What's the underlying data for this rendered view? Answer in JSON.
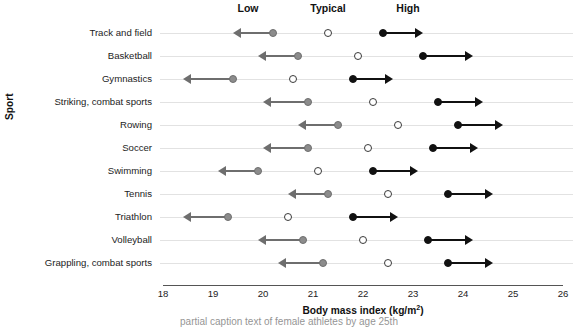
{
  "chart_data": {
    "type": "scatter",
    "title": "",
    "xlabel": "Body mass index (kg/m2)",
    "xlabel_html": "Body mass index (kg/m<sup>2</sup>)",
    "ylabel": "Sport",
    "xlim": [
      18,
      26
    ],
    "xticks": [
      18,
      19,
      20,
      21,
      22,
      23,
      24,
      25,
      26
    ],
    "grid": true,
    "legend_position": "top",
    "series": [
      {
        "name": "Low",
        "marker": "filled-gray-circle",
        "color": "#8c8c8c",
        "arrow": "left"
      },
      {
        "name": "Typical",
        "marker": "open-circle",
        "color": "#ffffff",
        "arrow": "none"
      },
      {
        "name": "High",
        "marker": "filled-black-circle",
        "color": "#111111",
        "arrow": "right"
      }
    ],
    "categories": [
      "Track and field",
      "Basketball",
      "Gymnastics",
      "Striking, combat sports",
      "Rowing",
      "Soccer",
      "Swimming",
      "Tennis",
      "Triathlon",
      "Volleyball",
      "Grappling, combat sports"
    ],
    "rows": [
      {
        "sport": "Track and field",
        "low": 20.2,
        "typical": 21.3,
        "high": 22.4,
        "low_arrow_end": 19.4,
        "high_arrow_end": 23.2
      },
      {
        "sport": "Basketball",
        "low": 20.7,
        "typical": 21.9,
        "high": 23.2,
        "low_arrow_end": 19.9,
        "high_arrow_end": 24.2
      },
      {
        "sport": "Gymnastics",
        "low": 19.4,
        "typical": 20.6,
        "high": 21.8,
        "low_arrow_end": 18.4,
        "high_arrow_end": 22.6
      },
      {
        "sport": "Striking, combat sports",
        "low": 20.9,
        "typical": 22.2,
        "high": 23.5,
        "low_arrow_end": 20.0,
        "high_arrow_end": 24.4
      },
      {
        "sport": "Rowing",
        "low": 21.5,
        "typical": 22.7,
        "high": 23.9,
        "low_arrow_end": 20.7,
        "high_arrow_end": 24.8
      },
      {
        "sport": "Soccer",
        "low": 20.9,
        "typical": 22.1,
        "high": 23.4,
        "low_arrow_end": 20.0,
        "high_arrow_end": 24.3
      },
      {
        "sport": "Swimming",
        "low": 19.9,
        "typical": 21.1,
        "high": 22.2,
        "low_arrow_end": 19.1,
        "high_arrow_end": 23.1
      },
      {
        "sport": "Tennis",
        "low": 21.3,
        "typical": 22.5,
        "high": 23.7,
        "low_arrow_end": 20.5,
        "high_arrow_end": 24.6
      },
      {
        "sport": "Triathlon",
        "low": 19.3,
        "typical": 20.5,
        "high": 21.8,
        "low_arrow_end": 18.4,
        "high_arrow_end": 22.7
      },
      {
        "sport": "Volleyball",
        "low": 20.8,
        "typical": 22.0,
        "high": 23.3,
        "low_arrow_end": 19.9,
        "high_arrow_end": 24.2
      },
      {
        "sport": "Grappling, combat sports",
        "low": 21.2,
        "typical": 22.5,
        "high": 23.7,
        "low_arrow_end": 20.3,
        "high_arrow_end": 24.6
      }
    ],
    "annotations": [
      {
        "text": "Low",
        "x": 19.7
      },
      {
        "text": "Typical",
        "x": 21.3
      },
      {
        "text": "High",
        "x": 22.9
      }
    ]
  },
  "caption": "partial caption text of female athletes by age 25th"
}
